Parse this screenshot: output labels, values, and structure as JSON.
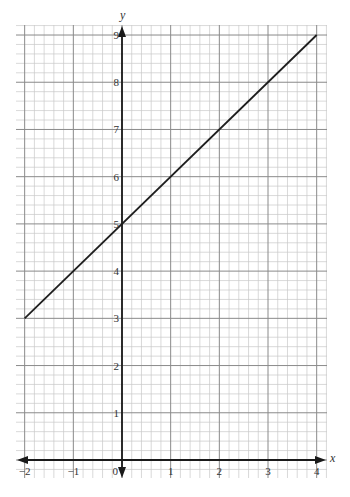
{
  "chart_data": {
    "type": "line",
    "title": "",
    "xlabel": "x",
    "ylabel": "y",
    "xlim": [
      -2.2,
      4.2
    ],
    "ylim": [
      0,
      9.4
    ],
    "grid": true,
    "minor_per_unit": 5,
    "x_ticks": [
      -2,
      -1,
      0,
      1,
      2,
      3,
      4
    ],
    "x_tick_labels": [
      "−2",
      "−1",
      "0",
      "1",
      "2",
      "3",
      "4"
    ],
    "y_ticks": [
      1,
      2,
      3,
      4,
      5,
      6,
      7,
      8,
      9
    ],
    "y_tick_labels": [
      "1",
      "2",
      "3",
      "4",
      "5",
      "6",
      "7",
      "8",
      "9"
    ],
    "series": [
      {
        "name": "y = x + 5",
        "x": [
          -2,
          4
        ],
        "y": [
          3,
          9
        ],
        "color": "#1e1e1e"
      }
    ],
    "legend": null
  },
  "layout": {
    "origin_px": [
      122,
      460
    ],
    "unit_px": [
      48.67,
      47.22
    ],
    "grid_px": {
      "left": 16,
      "right": 327,
      "top": 25,
      "bottom": 478
    }
  }
}
